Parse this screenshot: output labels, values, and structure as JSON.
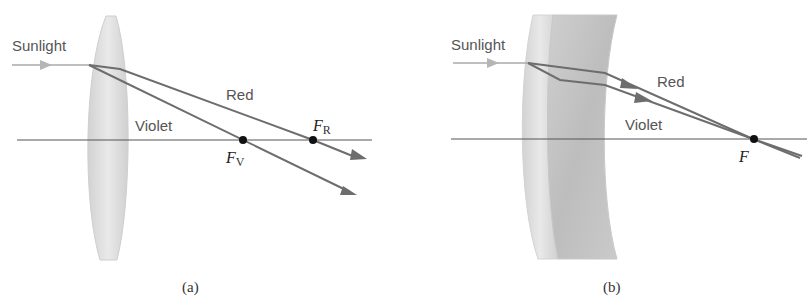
{
  "panel_a": {
    "caption": "(a)",
    "input_label": "Sunlight",
    "red_label": "Red",
    "violet_label": "Violet",
    "focus_red": {
      "letter": "F",
      "sub": "R"
    },
    "focus_violet": {
      "letter": "F",
      "sub": "V"
    }
  },
  "panel_b": {
    "caption": "(b)",
    "input_label": "Sunlight",
    "red_label": "Red",
    "violet_label": "Violet",
    "focus": {
      "letter": "F"
    }
  },
  "colors": {
    "ray": "#6d6d6d",
    "axis": "#555555",
    "lens": "#d9d9d9",
    "flint": "#c4c4c4",
    "sunlight_arrow": "#aaaaaa"
  }
}
